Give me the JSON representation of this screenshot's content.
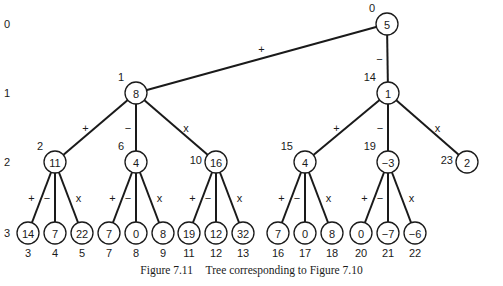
{
  "caption": {
    "figure": "Figure 7.11",
    "text": "Tree corresponding to Figure 7.10"
  },
  "levels": [
    {
      "label": "0",
      "y": 24
    },
    {
      "label": "1",
      "y": 93
    },
    {
      "label": "2",
      "y": 162
    },
    {
      "label": "3",
      "y": 233
    }
  ],
  "nodes": [
    {
      "id": 0,
      "value": "5",
      "x": 387,
      "y": 24,
      "parent": null,
      "op": null,
      "idx_pos": "tl"
    },
    {
      "id": 1,
      "value": "8",
      "x": 136,
      "y": 93,
      "parent": 0,
      "op": "+",
      "idx_pos": "tl"
    },
    {
      "id": 2,
      "value": "11",
      "x": 55,
      "y": 162,
      "parent": 1,
      "op": "+",
      "idx_pos": "tl"
    },
    {
      "id": 3,
      "value": "14",
      "x": 28,
      "y": 233,
      "parent": 2,
      "op": "+",
      "idx_pos": "below"
    },
    {
      "id": 4,
      "value": "7",
      "x": 55,
      "y": 233,
      "parent": 2,
      "op": "−",
      "idx_pos": "below"
    },
    {
      "id": 5,
      "value": "22",
      "x": 82,
      "y": 233,
      "parent": 2,
      "op": "x",
      "idx_pos": "below"
    },
    {
      "id": 6,
      "value": "4",
      "x": 136,
      "y": 162,
      "parent": 1,
      "op": "−",
      "idx_pos": "tl"
    },
    {
      "id": 7,
      "value": "7",
      "x": 109,
      "y": 233,
      "parent": 6,
      "op": "+",
      "idx_pos": "below"
    },
    {
      "id": 8,
      "value": "0",
      "x": 136,
      "y": 233,
      "parent": 6,
      "op": "−",
      "idx_pos": "below"
    },
    {
      "id": 9,
      "value": "8",
      "x": 163,
      "y": 233,
      "parent": 6,
      "op": "x",
      "idx_pos": "below"
    },
    {
      "id": 10,
      "value": "16",
      "x": 216,
      "y": 162,
      "parent": 1,
      "op": "x",
      "idx_pos": "l"
    },
    {
      "id": 11,
      "value": "19",
      "x": 189,
      "y": 233,
      "parent": 10,
      "op": "+",
      "idx_pos": "below"
    },
    {
      "id": 12,
      "value": "12",
      "x": 216,
      "y": 233,
      "parent": 10,
      "op": "−",
      "idx_pos": "below"
    },
    {
      "id": 13,
      "value": "32",
      "x": 243,
      "y": 233,
      "parent": 10,
      "op": "x",
      "idx_pos": "below"
    },
    {
      "id": 14,
      "value": "1",
      "x": 388,
      "y": 93,
      "parent": 0,
      "op": "−",
      "idx_pos": "tl"
    },
    {
      "id": 15,
      "value": "4",
      "x": 305,
      "y": 162,
      "parent": 14,
      "op": "+",
      "idx_pos": "tl"
    },
    {
      "id": 16,
      "value": "7",
      "x": 278,
      "y": 233,
      "parent": 15,
      "op": "+",
      "idx_pos": "below"
    },
    {
      "id": 17,
      "value": "0",
      "x": 305,
      "y": 233,
      "parent": 15,
      "op": "−",
      "idx_pos": "below"
    },
    {
      "id": 18,
      "value": "8",
      "x": 332,
      "y": 233,
      "parent": 15,
      "op": "x",
      "idx_pos": "below"
    },
    {
      "id": 19,
      "value": "−3",
      "x": 388,
      "y": 162,
      "parent": 14,
      "op": "−",
      "idx_pos": "tl"
    },
    {
      "id": 20,
      "value": "0",
      "x": 361,
      "y": 233,
      "parent": 19,
      "op": "+",
      "idx_pos": "below"
    },
    {
      "id": 21,
      "value": "−7",
      "x": 388,
      "y": 233,
      "parent": 19,
      "op": "−",
      "idx_pos": "below"
    },
    {
      "id": 22,
      "value": "−6",
      "x": 415,
      "y": 233,
      "parent": 19,
      "op": "x",
      "idx_pos": "below"
    },
    {
      "id": 23,
      "value": "2",
      "x": 467,
      "y": 162,
      "parent": 14,
      "op": "x",
      "idx_pos": "l"
    }
  ],
  "style": {
    "line_color": "#1a1a1a",
    "node_fill": "#ffffff",
    "node_radius": 11
  }
}
